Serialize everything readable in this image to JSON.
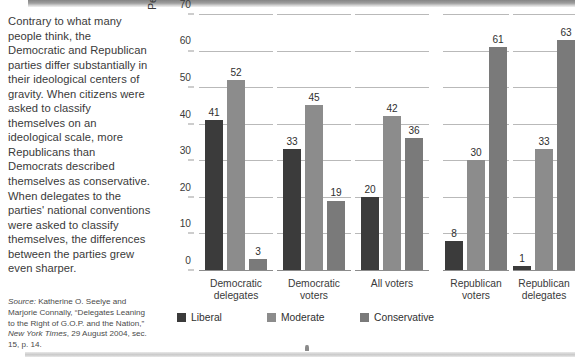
{
  "body_text": "Contrary to what many people think, the Democratic and Republican parties differ substantially in their ideological centers of gravity. When citizens were asked to classify themselves on an ideological scale, more Republicans than Democrats described themselves as conservative. When delegates to the parties' national conventions were asked to classify themselves, the differences between the parties grew even sharper.",
  "source": {
    "prefix": "Source:",
    "text": " Katherine O. Seelye and Marjorie Connally, “Delegates Leaning to the Right of G.O.P. and the Nation,” ",
    "italic_title": "New York Times",
    "suffix": ", 29 August 2004, sec. 15, p. 14."
  },
  "colors": {
    "liberal": "#3b3b3b",
    "moderate": "#8c8c8c",
    "conservative": "#7a7a7a",
    "gridline": "#b9b9b9",
    "axis": "#8c8c8c",
    "text": "#3a3a3a"
  },
  "chart_data": {
    "type": "bar",
    "title": "",
    "xlabel": "",
    "ylabel": "Percentage of respondents",
    "ylim": [
      0,
      70
    ],
    "yticks": [
      0,
      10,
      20,
      30,
      40,
      50,
      60,
      70
    ],
    "grid": true,
    "legend_position": "bottom",
    "categories": [
      "Democratic\ndelegates",
      "Democratic\nvoters",
      "All voters",
      "Republican\nvoters",
      "Republican\ndelegates"
    ],
    "series": [
      {
        "name": "Liberal",
        "values": [
          41,
          33,
          20,
          8,
          1
        ]
      },
      {
        "name": "Moderate",
        "values": [
          52,
          45,
          42,
          30,
          33
        ]
      },
      {
        "name": "Conservative",
        "values": [
          3,
          19,
          36,
          61,
          63
        ]
      }
    ]
  }
}
